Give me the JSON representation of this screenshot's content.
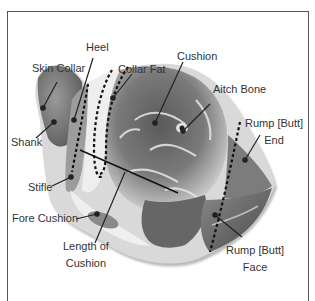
{
  "diagram": {
    "labels": {
      "heel": "Heel",
      "skin_collar": "Skin Collar",
      "collar_fat": "Collar Fat",
      "cushion": "Cushion",
      "aitch_bone": "Aitch Bone",
      "rump_end_1": "Rump [Butt]",
      "rump_end_2": "End",
      "shank": "Shank",
      "stifle": "Stifle",
      "fore_cushion": "Fore Cushion",
      "length_of_cushion_1": "Length of",
      "length_of_cushion_2": "Cushion",
      "rump_face_1": "Rump [Butt]",
      "rump_face_2": "Face"
    },
    "colors": {
      "frame": "#555555",
      "label_text": "#333333",
      "leader_line": "#222222",
      "meat_dark": "#4a4a4a",
      "meat_mid": "#8a8a8a",
      "fat_light": "#e8e8e8"
    }
  }
}
